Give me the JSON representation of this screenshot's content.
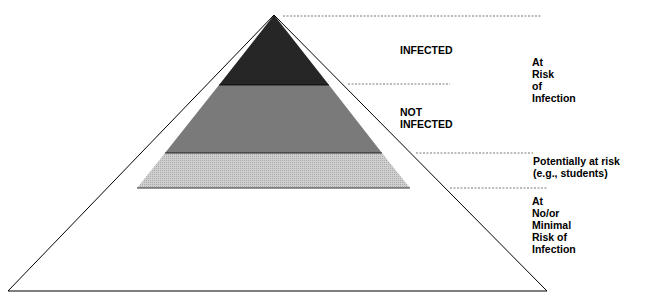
{
  "diagram": {
    "type": "risk-pyramid",
    "layers": [
      {
        "id": "infected",
        "label": "INFECTED",
        "fill": "#2b2b2b"
      },
      {
        "id": "not-infected",
        "label": "NOT\nINFECTED",
        "fill": "#777777"
      },
      {
        "id": "potentially-at-risk",
        "label": "Potentially at risk\n(e.g., students)",
        "fill": "#c4c4c4"
      },
      {
        "id": "minimal-risk",
        "label": "At\nNo/or\nMinimal\nRisk of\nInfection",
        "fill": "#ffffff"
      }
    ],
    "group_labels": {
      "at_risk": "At\nRisk\nof\nInfection"
    }
  }
}
